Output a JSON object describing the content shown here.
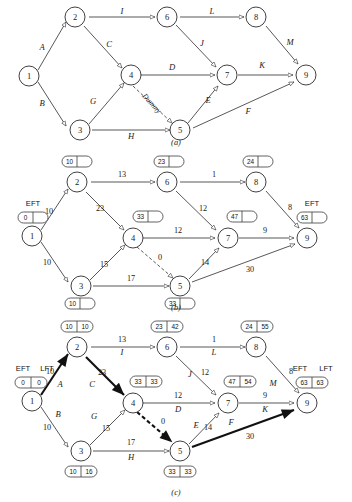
{
  "figure": {
    "panels": [
      {
        "id": "a",
        "caption": "(a)",
        "nodes": [
          "1",
          "2",
          "3",
          "4",
          "5",
          "6",
          "7",
          "8",
          "9"
        ],
        "edges": [
          {
            "from": "1",
            "to": "2",
            "label": "A"
          },
          {
            "from": "1",
            "to": "3",
            "label": "B"
          },
          {
            "from": "2",
            "to": "4",
            "label": "C"
          },
          {
            "from": "2",
            "to": "6",
            "label": "I"
          },
          {
            "from": "3",
            "to": "4",
            "label": "G"
          },
          {
            "from": "3",
            "to": "5",
            "label": "H"
          },
          {
            "from": "4",
            "to": "7",
            "label": "D"
          },
          {
            "from": "4",
            "to": "5",
            "label": "Dummy",
            "style": "dashed"
          },
          {
            "from": "5",
            "to": "7",
            "label": "E"
          },
          {
            "from": "5",
            "to": "9",
            "label": "F"
          },
          {
            "from": "6",
            "to": "7",
            "label": "J"
          },
          {
            "from": "6",
            "to": "8",
            "label": "L"
          },
          {
            "from": "7",
            "to": "9",
            "label": "K"
          },
          {
            "from": "8",
            "to": "9",
            "label": "M"
          }
        ]
      },
      {
        "id": "b",
        "caption": "(b)",
        "header_left": "EFT",
        "header_right": "EFT",
        "nodes": [
          "1",
          "2",
          "3",
          "4",
          "5",
          "6",
          "7",
          "8",
          "9"
        ],
        "eft": {
          "1": "0",
          "2": "10",
          "3": "10",
          "4": "33",
          "5": "33",
          "6": "23",
          "7": "47",
          "8": "24",
          "9": "63"
        },
        "edges": [
          {
            "from": "1",
            "to": "2",
            "duration": "10"
          },
          {
            "from": "1",
            "to": "3",
            "duration": "10"
          },
          {
            "from": "2",
            "to": "4",
            "duration": "23"
          },
          {
            "from": "2",
            "to": "6",
            "duration": "13"
          },
          {
            "from": "3",
            "to": "4",
            "duration": "15"
          },
          {
            "from": "3",
            "to": "5",
            "duration": "17"
          },
          {
            "from": "4",
            "to": "7",
            "duration": "12"
          },
          {
            "from": "4",
            "to": "5",
            "duration": "0",
            "style": "dashed"
          },
          {
            "from": "5",
            "to": "7",
            "duration": "14"
          },
          {
            "from": "5",
            "to": "9",
            "duration": "30"
          },
          {
            "from": "6",
            "to": "7",
            "duration": "12"
          },
          {
            "from": "6",
            "to": "8",
            "duration": "1"
          },
          {
            "from": "7",
            "to": "9",
            "duration": "9"
          },
          {
            "from": "8",
            "to": "9",
            "duration": "8"
          }
        ]
      },
      {
        "id": "c",
        "caption": "(c)",
        "header_left_eft": "EFT",
        "header_left_lft": "LFT",
        "header_right_eft": "EFT",
        "header_right_lft": "LFT",
        "nodes": [
          "1",
          "2",
          "3",
          "4",
          "5",
          "6",
          "7",
          "8",
          "9"
        ],
        "eft_lft": {
          "1": {
            "eft": "0",
            "lft": "0"
          },
          "2": {
            "eft": "10",
            "lft": "10"
          },
          "3": {
            "eft": "10",
            "lft": "16"
          },
          "4": {
            "eft": "33",
            "lft": "33"
          },
          "5": {
            "eft": "33",
            "lft": "33"
          },
          "6": {
            "eft": "23",
            "lft": "42"
          },
          "7": {
            "eft": "47",
            "lft": "54"
          },
          "8": {
            "eft": "24",
            "lft": "55"
          },
          "9": {
            "eft": "63",
            "lft": "63"
          }
        },
        "edges": [
          {
            "from": "1",
            "to": "2",
            "duration": "10",
            "label": "A",
            "critical": true
          },
          {
            "from": "1",
            "to": "3",
            "duration": "10",
            "label": "B",
            "critical": false
          },
          {
            "from": "2",
            "to": "4",
            "duration": "23",
            "label": "C",
            "critical": true
          },
          {
            "from": "2",
            "to": "6",
            "duration": "13",
            "label": "I",
            "critical": false
          },
          {
            "from": "3",
            "to": "4",
            "duration": "15",
            "label": "G",
            "critical": false
          },
          {
            "from": "3",
            "to": "5",
            "duration": "17",
            "label": "H",
            "critical": false
          },
          {
            "from": "4",
            "to": "7",
            "duration": "12",
            "label": "D",
            "critical": false
          },
          {
            "from": "4",
            "to": "5",
            "duration": "0",
            "label": "",
            "style": "dashed",
            "critical": true
          },
          {
            "from": "5",
            "to": "7",
            "duration": "14",
            "label": "E",
            "critical": false
          },
          {
            "from": "5",
            "to": "9",
            "duration": "30",
            "label": "F",
            "critical": true
          },
          {
            "from": "6",
            "to": "7",
            "duration": "12",
            "label": "J",
            "critical": false
          },
          {
            "from": "6",
            "to": "8",
            "duration": "1",
            "label": "L",
            "critical": false
          },
          {
            "from": "7",
            "to": "9",
            "duration": "9",
            "label": "K",
            "critical": false
          },
          {
            "from": "8",
            "to": "9",
            "duration": "8",
            "label": "M",
            "critical": false
          }
        ]
      }
    ]
  }
}
